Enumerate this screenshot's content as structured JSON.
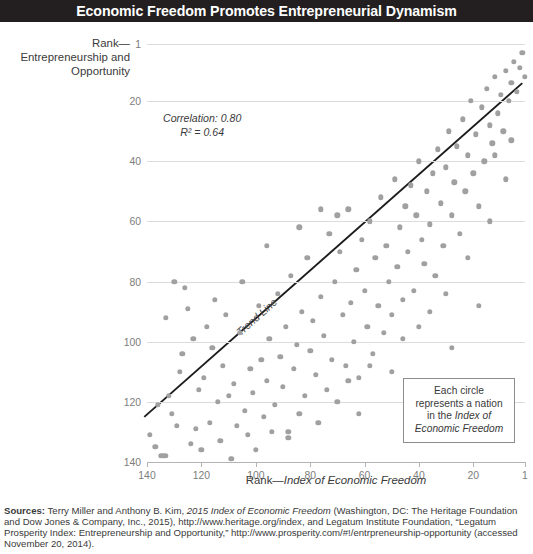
{
  "title": "Economic Freedom Promotes Entrepreneurial Dynamism",
  "y_caption": "Rank—Entrepreneurship and Opportunity",
  "x_caption_plain": "Rank—",
  "x_caption_italic": "Index of Economic Freedom",
  "annotation": {
    "correlation": "Correlation: 0.80",
    "r_squared": "R² = 0.64"
  },
  "trend_label": "Trend Line",
  "legend": {
    "line1": "Each circle",
    "line2": "represents a nation",
    "line3_plain": "in the ",
    "line3_italic": "Index of",
    "line4_italic": "Economic Freedom"
  },
  "sources": {
    "label": "Sources:",
    "text_a": " Terry Miller and Anthony B. Kim, ",
    "italic_a": "2015 Index of Economic Freedom",
    "text_b": " (Washington, DC: The Heritage Foundation and Dow Jones & Company, Inc., 2015), http://www.heritage.org/index, and Legatum Institute Foundation, “Legatum Prosperity Index: Entrepreneurship and Opportunity,” http://www.prosperity.com/#!/entrpreneurship-opportunity (accessed November 20, 2014)."
  },
  "colors": {
    "title_bar": "#231f20",
    "title_text": "#ffffff",
    "dot": "#a0a0a0",
    "gridline": "#dcdcdc",
    "trendline": "#1c1c1c",
    "tick_text": "#7d7d7d",
    "legend_border": "#8d8d8d"
  },
  "chart_data": {
    "type": "scatter",
    "title": "Economic Freedom Promotes Entrepreneurial Dynamism",
    "xlabel": "Rank—Index of Economic Freedom",
    "ylabel": "Rank—Entrepreneurship and Opportunity",
    "xlim": [
      140,
      1
    ],
    "ylim": [
      1,
      140
    ],
    "x_reversed": true,
    "y_reversed": true,
    "xticks": [
      140,
      120,
      100,
      80,
      60,
      40,
      20,
      1
    ],
    "yticks": [
      1,
      20,
      40,
      60,
      80,
      100,
      120,
      140
    ],
    "grid": "horizontal",
    "legend_position": "bottom-right",
    "annotations": [
      "Correlation: 0.80",
      "R² = 0.64",
      "Trend Line"
    ],
    "trendline": {
      "x_start": 141,
      "y_start": 125,
      "x_end": 2,
      "y_end": 14
    },
    "points": [
      [
        139,
        131
      ],
      [
        137,
        135
      ],
      [
        136,
        121
      ],
      [
        135,
        138
      ],
      [
        134,
        138
      ],
      [
        133,
        138
      ],
      [
        133,
        92
      ],
      [
        132,
        118
      ],
      [
        131,
        124
      ],
      [
        130,
        80
      ],
      [
        129,
        128
      ],
      [
        128,
        110
      ],
      [
        127,
        104
      ],
      [
        126,
        82
      ],
      [
        125,
        89
      ],
      [
        124,
        134
      ],
      [
        123,
        99
      ],
      [
        122,
        129
      ],
      [
        121,
        116
      ],
      [
        120,
        136
      ],
      [
        119,
        112
      ],
      [
        118,
        95
      ],
      [
        117,
        127
      ],
      [
        116,
        102
      ],
      [
        115,
        86
      ],
      [
        114,
        120
      ],
      [
        113,
        133
      ],
      [
        112,
        108
      ],
      [
        111,
        91
      ],
      [
        110,
        118
      ],
      [
        109,
        139
      ],
      [
        108,
        114
      ],
      [
        107,
        128
      ],
      [
        106,
        97
      ],
      [
        105,
        80
      ],
      [
        104,
        123
      ],
      [
        103,
        131
      ],
      [
        102,
        109
      ],
      [
        101,
        117
      ],
      [
        100,
        136
      ],
      [
        99,
        88
      ],
      [
        98,
        106
      ],
      [
        97,
        125
      ],
      [
        96,
        113
      ],
      [
        95,
        99
      ],
      [
        94,
        130
      ],
      [
        93,
        121
      ],
      [
        92,
        84
      ],
      [
        91,
        105
      ],
      [
        90,
        115
      ],
      [
        89,
        95
      ],
      [
        88,
        132
      ],
      [
        87,
        78
      ],
      [
        86,
        109
      ],
      [
        85,
        101
      ],
      [
        84,
        124
      ],
      [
        83,
        90
      ],
      [
        82,
        118
      ],
      [
        81,
        72
      ],
      [
        80,
        103
      ],
      [
        79,
        93
      ],
      [
        78,
        111
      ],
      [
        77,
        127
      ],
      [
        76,
        85
      ],
      [
        75,
        98
      ],
      [
        74,
        116
      ],
      [
        73,
        64
      ],
      [
        72,
        106
      ],
      [
        71,
        80
      ],
      [
        70,
        120
      ],
      [
        69,
        70
      ],
      [
        68,
        91
      ],
      [
        67,
        108
      ],
      [
        66,
        56
      ],
      [
        65,
        87
      ],
      [
        64,
        100
      ],
      [
        63,
        76
      ],
      [
        62,
        112
      ],
      [
        61,
        66
      ],
      [
        60,
        83
      ],
      [
        59,
        95
      ],
      [
        58,
        60
      ],
      [
        57,
        104
      ],
      [
        56,
        72
      ],
      [
        55,
        88
      ],
      [
        54,
        52
      ],
      [
        53,
        97
      ],
      [
        52,
        68
      ],
      [
        51,
        80
      ],
      [
        50,
        91
      ],
      [
        49,
        46
      ],
      [
        48,
        75
      ],
      [
        47,
        62
      ],
      [
        46,
        86
      ],
      [
        45,
        55
      ],
      [
        44,
        70
      ],
      [
        43,
        48
      ],
      [
        42,
        83
      ],
      [
        41,
        58
      ],
      [
        40,
        40
      ],
      [
        39,
        66
      ],
      [
        38,
        74
      ],
      [
        37,
        50
      ],
      [
        36,
        61
      ],
      [
        35,
        44
      ],
      [
        34,
        78
      ],
      [
        33,
        36
      ],
      [
        32,
        54
      ],
      [
        31,
        68
      ],
      [
        30,
        42
      ],
      [
        29,
        30
      ],
      [
        28,
        58
      ],
      [
        27,
        47
      ],
      [
        26,
        35
      ],
      [
        25,
        64
      ],
      [
        24,
        26
      ],
      [
        23,
        50
      ],
      [
        22,
        38
      ],
      [
        21,
        20
      ],
      [
        20,
        44
      ],
      [
        19,
        31
      ],
      [
        18,
        55
      ],
      [
        17,
        22
      ],
      [
        16,
        40
      ],
      [
        15,
        16
      ],
      [
        14,
        28
      ],
      [
        13,
        34
      ],
      [
        12,
        12
      ],
      [
        11,
        24
      ],
      [
        10,
        18
      ],
      [
        9,
        30
      ],
      [
        8,
        10
      ],
      [
        7,
        20
      ],
      [
        6,
        14
      ],
      [
        5,
        7
      ],
      [
        4,
        17
      ],
      [
        3,
        9
      ],
      [
        2,
        4
      ],
      [
        1,
        12
      ],
      [
        46,
        99
      ],
      [
        58,
        108
      ],
      [
        66,
        113
      ],
      [
        30,
        84
      ],
      [
        22,
        72
      ],
      [
        12,
        38
      ],
      [
        36,
        90
      ],
      [
        70,
        58
      ],
      [
        84,
        62
      ],
      [
        96,
        68
      ],
      [
        50,
        110
      ],
      [
        18,
        88
      ],
      [
        8,
        46
      ],
      [
        28,
        102
      ],
      [
        40,
        95
      ],
      [
        62,
        124
      ],
      [
        76,
        56
      ],
      [
        88,
        130
      ],
      [
        14,
        60
      ],
      [
        6,
        33
      ]
    ]
  }
}
